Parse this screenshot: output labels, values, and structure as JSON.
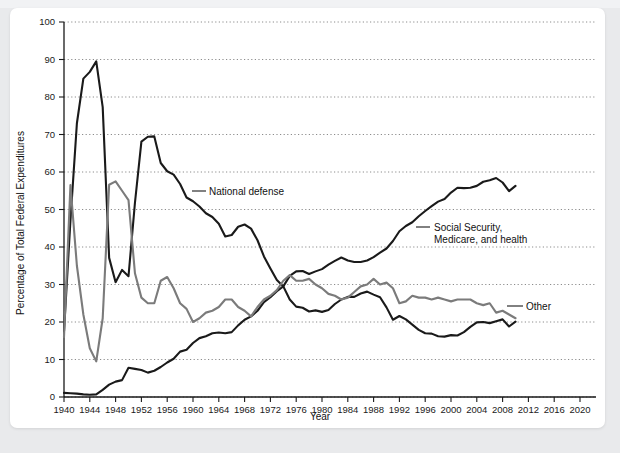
{
  "card": {
    "background_color": "#ffffff",
    "page_background_color": "#e9eaec"
  },
  "chart_data": {
    "type": "line",
    "title": "",
    "xlabel": "Year",
    "ylabel": "Percentage of Total Federal Expenditures",
    "xlim": [
      1940,
      2020
    ],
    "ylim": [
      0,
      100
    ],
    "grid": true,
    "legend": "inline-annotations",
    "x_ticks": [
      1940,
      1944,
      1948,
      1952,
      1956,
      1960,
      1964,
      1968,
      1972,
      1976,
      1980,
      1984,
      1988,
      1992,
      1996,
      2000,
      2004,
      2008,
      2012,
      2016,
      2020
    ],
    "y_ticks": [
      0,
      10,
      20,
      30,
      40,
      50,
      60,
      70,
      80,
      90,
      100
    ],
    "series": [
      {
        "name": "National defense",
        "color": "#1a1a1a",
        "width": 2.1,
        "label_text": "National defense",
        "x": [
          1940,
          1941,
          1942,
          1943,
          1944,
          1945,
          1946,
          1947,
          1948,
          1949,
          1950,
          1951,
          1952,
          1953,
          1954,
          1955,
          1956,
          1957,
          1958,
          1959,
          1960,
          1961,
          1962,
          1963,
          1964,
          1965,
          1966,
          1967,
          1968,
          1969,
          1970,
          1971,
          1972,
          1973,
          1974,
          1975,
          1976,
          1977,
          1978,
          1979,
          1980,
          1981,
          1982,
          1983,
          1984,
          1985,
          1986,
          1987,
          1988,
          1989,
          1990,
          1991,
          1992,
          1993,
          1994,
          1995,
          1996,
          1997,
          1998,
          1999,
          2000,
          2001,
          2002,
          2003,
          2004,
          2005,
          2006,
          2007,
          2008,
          2009,
          2010
        ],
        "values": [
          17.5,
          47.1,
          73.0,
          84.9,
          86.7,
          89.5,
          77.3,
          37.1,
          30.6,
          33.9,
          32.2,
          51.8,
          68.1,
          69.4,
          69.5,
          62.4,
          60.2,
          59.3,
          56.8,
          53.2,
          52.2,
          50.8,
          49.0,
          48.0,
          46.2,
          42.8,
          43.2,
          45.4,
          46.0,
          44.9,
          41.8,
          37.5,
          34.3,
          31.2,
          29.5,
          26.0,
          24.1,
          23.8,
          22.8,
          23.1,
          22.7,
          23.2,
          24.8,
          26.0,
          26.7,
          26.7,
          27.6,
          28.1,
          27.3,
          26.6,
          23.9,
          20.6,
          21.6,
          20.7,
          19.3,
          17.9,
          17.0,
          16.9,
          16.2,
          16.1,
          16.5,
          16.4,
          17.3,
          18.7,
          19.9,
          20.0,
          19.7,
          20.2,
          20.7,
          18.8,
          20.1
        ]
      },
      {
        "name": "Social Security, Medicare, and health",
        "color": "#1a1a1a",
        "width": 2.1,
        "label_text_line1": "Social Security,",
        "label_text_line2": "Medicare, and health",
        "x": [
          1940,
          1941,
          1942,
          1943,
          1944,
          1945,
          1946,
          1947,
          1948,
          1949,
          1950,
          1951,
          1952,
          1953,
          1954,
          1955,
          1956,
          1957,
          1958,
          1959,
          1960,
          1961,
          1962,
          1963,
          1964,
          1965,
          1966,
          1967,
          1968,
          1969,
          1970,
          1971,
          1972,
          1973,
          1974,
          1975,
          1976,
          1977,
          1978,
          1979,
          1980,
          1981,
          1982,
          1983,
          1984,
          1985,
          1986,
          1987,
          1988,
          1989,
          1990,
          1991,
          1992,
          1993,
          1994,
          1995,
          1996,
          1997,
          1998,
          1999,
          2000,
          2001,
          2002,
          2003,
          2004,
          2005,
          2006,
          2007,
          2008,
          2009,
          2010
        ],
        "values": [
          1.1,
          1.0,
          0.9,
          0.7,
          0.6,
          0.7,
          1.9,
          3.3,
          4.1,
          4.5,
          7.8,
          7.5,
          7.2,
          6.5,
          7.0,
          8.0,
          9.2,
          10.2,
          12.1,
          12.6,
          14.4,
          15.7,
          16.2,
          17.0,
          17.2,
          17.0,
          17.3,
          19.1,
          20.6,
          21.5,
          23.0,
          25.3,
          26.6,
          28.2,
          29.5,
          32.3,
          33.5,
          33.6,
          32.8,
          33.5,
          34.1,
          35.3,
          36.3,
          37.2,
          36.4,
          36.0,
          36.0,
          36.4,
          37.3,
          38.5,
          39.6,
          41.6,
          44.2,
          45.6,
          46.6,
          48.2,
          49.6,
          50.9,
          52.1,
          52.8,
          54.5,
          55.8,
          55.7,
          55.8,
          56.3,
          57.4,
          57.8,
          58.4,
          57.2,
          54.9,
          56.3
        ]
      },
      {
        "name": "Other",
        "color": "#7b7b7b",
        "width": 2.1,
        "label_text": "Other",
        "x": [
          1940,
          1941,
          1942,
          1943,
          1944,
          1945,
          1946,
          1947,
          1948,
          1949,
          1950,
          1951,
          1952,
          1953,
          1954,
          1955,
          1956,
          1957,
          1958,
          1959,
          1960,
          1961,
          1962,
          1963,
          1964,
          1965,
          1966,
          1967,
          1968,
          1969,
          1970,
          1971,
          1972,
          1973,
          1974,
          1975,
          1976,
          1977,
          1978,
          1979,
          1980,
          1981,
          1982,
          1983,
          1984,
          1985,
          1986,
          1987,
          1988,
          1989,
          1990,
          1991,
          1992,
          1993,
          1994,
          1995,
          1996,
          1997,
          1998,
          1999,
          2000,
          2001,
          2002,
          2003,
          2004,
          2005,
          2006,
          2007,
          2008,
          2009,
          2010
        ],
        "values": [
          16.0,
          56.5,
          35.0,
          22.0,
          13.0,
          9.5,
          21.0,
          56.6,
          57.5,
          55.0,
          52.5,
          33.0,
          26.5,
          25.0,
          25.0,
          31.0,
          32.0,
          29.0,
          25.0,
          23.5,
          20.0,
          21.0,
          22.5,
          23.0,
          24.0,
          26.0,
          26.0,
          24.0,
          23.0,
          21.5,
          24.0,
          26.0,
          27.0,
          28.5,
          31.0,
          32.5,
          31.0,
          31.0,
          31.5,
          30.0,
          29.0,
          27.5,
          27.0,
          26.0,
          26.5,
          28.0,
          29.5,
          30.0,
          31.5,
          30.0,
          30.5,
          29.0,
          25.0,
          25.5,
          27.0,
          26.5,
          26.5,
          26.0,
          26.5,
          26.0,
          25.5,
          26.0,
          26.0,
          26.0,
          25.0,
          24.5,
          25.0,
          22.5,
          23.0,
          22.0,
          21.0
        ]
      }
    ],
    "annotations": [
      {
        "name": "national-defense-label",
        "text": "National defense",
        "x": 1958,
        "y": 55
      },
      {
        "name": "social-security-label",
        "text": "Social Security, Medicare, and health",
        "x": 1995,
        "y": 45
      },
      {
        "name": "other-label",
        "text": "Other",
        "x": 2012,
        "y": 27
      }
    ]
  }
}
